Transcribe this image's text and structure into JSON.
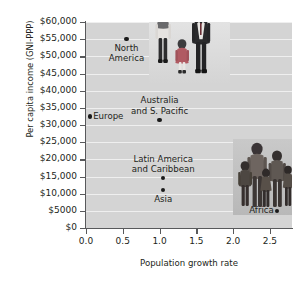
{
  "chart_data": {
    "type": "scatter",
    "title": "",
    "xlabel": "Population growth rate",
    "ylabel": "Per capita income (GNI-PPP)",
    "xlim": [
      0.0,
      2.8
    ],
    "ylim": [
      0,
      60000
    ],
    "grid": true,
    "legend": "none",
    "xticks": [
      "0.0",
      "0.5",
      "1.0",
      "1.5",
      "2.0",
      "2.5"
    ],
    "xtick_values": [
      0.0,
      0.5,
      1.0,
      1.5,
      2.0,
      2.5
    ],
    "yticks": [
      "$0",
      "$5000",
      "$10,000",
      "$15,000",
      "$20,000",
      "$25,000",
      "$30,000",
      "$35,000",
      "$40,000",
      "$45,000",
      "$50,000",
      "$55,000",
      "$60,000"
    ],
    "ytick_values": [
      0,
      5000,
      10000,
      15000,
      20000,
      25000,
      30000,
      35000,
      40000,
      45000,
      50000,
      55000,
      60000
    ],
    "points": [
      {
        "label": "North\nAmerica",
        "x": 0.55,
        "y": 55000,
        "label_pos": "below"
      },
      {
        "label": "Europe",
        "x": 0.05,
        "y": 32500,
        "label_pos": "right"
      },
      {
        "label": "Australia\nand S. Pacific",
        "x": 1.0,
        "y": 31500,
        "label_pos": "above"
      },
      {
        "label": "Latin America\nand Caribbean",
        "x": 1.05,
        "y": 14500,
        "label_pos": "above"
      },
      {
        "label": "Asia",
        "x": 1.05,
        "y": 11000,
        "label_pos": "below"
      },
      {
        "label": "Africa",
        "x": 2.6,
        "y": 5000,
        "label_pos": "left"
      }
    ],
    "photos": [
      {
        "name": "north-america-family-photo",
        "caption": ""
      },
      {
        "name": "africa-family-photo",
        "caption": ""
      }
    ]
  }
}
